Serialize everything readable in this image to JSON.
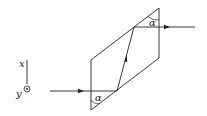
{
  "diagram": {
    "type": "optics-prism-ray",
    "labels": {
      "axis_x": "x",
      "axis_y": "y",
      "angle_top": "α",
      "angle_bottom": "α"
    },
    "colors": {
      "stroke": "#222222",
      "background": "#ffffff"
    }
  }
}
